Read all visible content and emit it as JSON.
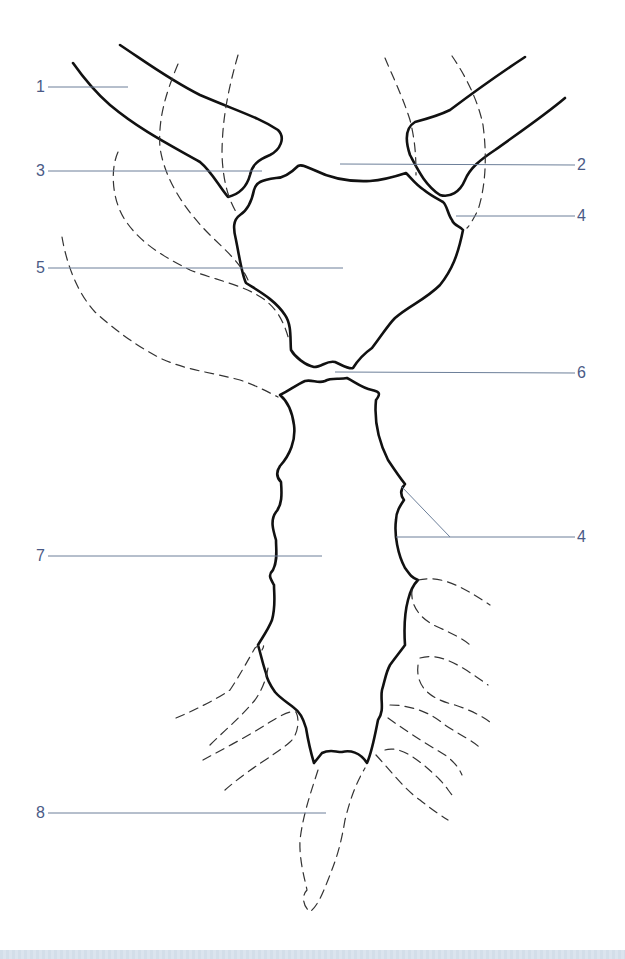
{
  "figure": {
    "type": "anatomical line drawing",
    "colors": {
      "outline": "#111111",
      "dashed_outline": "#333333",
      "leader_line": "#6c7f99",
      "label_text": "#4a5a86",
      "bottom_band": "#d5e0ea"
    },
    "labels": [
      {
        "id": "1",
        "text": "1",
        "side": "left",
        "x": 36,
        "y": 79,
        "line": [
          48,
          87,
          128,
          87
        ]
      },
      {
        "id": "3",
        "text": "3",
        "side": "left",
        "x": 36,
        "y": 163,
        "line": [
          48,
          171,
          262,
          171
        ]
      },
      {
        "id": "5",
        "text": "5",
        "side": "left",
        "x": 36,
        "y": 260,
        "line": [
          48,
          268,
          343,
          268
        ]
      },
      {
        "id": "7",
        "text": "7",
        "side": "left",
        "x": 36,
        "y": 548,
        "line": [
          48,
          556,
          322,
          556
        ]
      },
      {
        "id": "8",
        "text": "8",
        "side": "left",
        "x": 36,
        "y": 805,
        "line": [
          48,
          813,
          326,
          813
        ]
      },
      {
        "id": "2",
        "text": "2",
        "side": "right",
        "x": 577,
        "y": 157,
        "line": [
          340,
          164,
          575,
          165
        ]
      },
      {
        "id": "4a",
        "text": "4",
        "side": "right",
        "x": 577,
        "y": 208,
        "line": [
          456,
          216,
          575,
          216
        ]
      },
      {
        "id": "6",
        "text": "6",
        "side": "right",
        "x": 577,
        "y": 365,
        "line": [
          335,
          372,
          575,
          373
        ]
      },
      {
        "id": "4b",
        "text": "4",
        "side": "right",
        "x": 577,
        "y": 529,
        "line": [
          396,
          537,
          575,
          537
        ],
        "extra_line": [
          401,
          486,
          450,
          537
        ]
      }
    ]
  }
}
